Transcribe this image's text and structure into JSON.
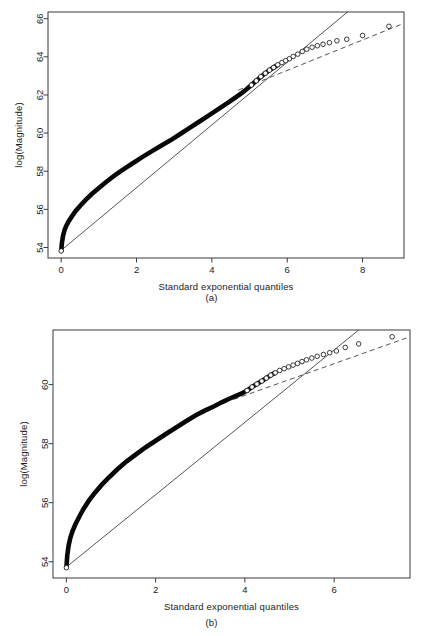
{
  "figure": {
    "panels": [
      {
        "id": "a",
        "caption": "(a)",
        "xlabel": "Standard exponential quantiles",
        "ylabel": "log(Magnitude)"
      },
      {
        "id": "b",
        "caption": "(b)",
        "xlabel": "Standard exponential quantiles",
        "ylabel": "log(Magnitude)"
      }
    ]
  },
  "chart_data": [
    {
      "type": "scatter",
      "panel": "(a)",
      "title": "",
      "xlabel": "Standard exponential quantiles",
      "ylabel": "log(Magnitude)",
      "xlim": [
        -0.35,
        9.1
      ],
      "ylim": [
        53.45,
        66.35
      ],
      "xticks": [
        0,
        2,
        4,
        6,
        8
      ],
      "yticks": [
        54,
        56,
        58,
        60,
        62,
        64,
        66
      ],
      "grid": false,
      "legend": "none",
      "marker": "open-circle",
      "series": [
        {
          "name": "sample quantiles",
          "note": "dense overlapping points form a continuous band at low quantiles, discrete circles in the upper tail",
          "x": [
            0.0,
            0.02,
            0.05,
            0.09,
            0.14,
            0.2,
            0.28,
            0.38,
            0.5,
            0.65,
            0.82,
            1.0,
            1.2,
            1.42,
            1.65,
            1.9,
            2.15,
            2.4,
            2.65,
            2.9,
            3.15,
            3.4,
            3.62,
            3.85,
            4.05,
            4.25,
            4.45,
            4.62,
            4.78,
            4.92,
            5.05,
            5.18,
            5.3,
            5.42,
            5.53,
            5.64,
            5.75,
            5.86,
            5.96,
            6.06,
            6.16,
            6.28,
            6.4,
            6.52,
            6.66,
            6.8,
            6.95,
            7.12,
            7.32,
            7.58,
            8.0,
            8.7
          ],
          "y": [
            53.82,
            54.25,
            54.62,
            54.92,
            55.16,
            55.38,
            55.62,
            55.9,
            56.18,
            56.5,
            56.82,
            57.12,
            57.45,
            57.78,
            58.1,
            58.42,
            58.74,
            59.04,
            59.34,
            59.62,
            59.94,
            60.26,
            60.54,
            60.84,
            61.1,
            61.36,
            61.62,
            61.86,
            62.08,
            62.3,
            62.52,
            62.74,
            62.96,
            63.14,
            63.3,
            63.44,
            63.58,
            63.7,
            63.8,
            63.9,
            64.02,
            64.14,
            64.28,
            64.4,
            64.5,
            64.58,
            64.66,
            64.74,
            64.84,
            64.92,
            65.12,
            65.6
          ]
        }
      ],
      "reference_lines": [
        {
          "name": "solid-fit-line",
          "style": "solid",
          "x": [
            0.0,
            7.6
          ],
          "y": [
            53.85,
            66.35
          ]
        },
        {
          "name": "dashed-tail-line",
          "style": "dashed",
          "x": [
            4.7,
            9.05
          ],
          "y": [
            62.25,
            65.72
          ]
        }
      ]
    },
    {
      "type": "scatter",
      "panel": "(b)",
      "title": "",
      "xlabel": "Standard exponential quantiles",
      "ylabel": "log(Magnitude)",
      "xlim": [
        -0.3,
        7.7
      ],
      "ylim": [
        53.45,
        61.85
      ],
      "xticks": [
        0,
        2,
        4,
        6
      ],
      "yticks": [
        54,
        56,
        58,
        60
      ],
      "grid": false,
      "legend": "none",
      "marker": "open-circle",
      "series": [
        {
          "name": "sample quantiles",
          "note": "dense overlapping points form a continuous band at low quantiles, discrete circles in the upper tail",
          "x": [
            0.0,
            0.02,
            0.05,
            0.09,
            0.14,
            0.2,
            0.28,
            0.38,
            0.5,
            0.64,
            0.8,
            0.97,
            1.15,
            1.35,
            1.56,
            1.78,
            2.0,
            2.22,
            2.45,
            2.68,
            2.9,
            3.1,
            3.3,
            3.48,
            3.65,
            3.8,
            3.93,
            4.05,
            4.16,
            4.27,
            4.38,
            4.48,
            4.58,
            4.68,
            4.78,
            4.88,
            4.98,
            5.08,
            5.18,
            5.28,
            5.38,
            5.5,
            5.62,
            5.76,
            5.9,
            6.05,
            6.25,
            6.55,
            7.3
          ],
          "y": [
            53.8,
            54.22,
            54.55,
            54.82,
            55.05,
            55.26,
            55.5,
            55.78,
            56.06,
            56.34,
            56.62,
            56.88,
            57.14,
            57.4,
            57.64,
            57.88,
            58.1,
            58.32,
            58.54,
            58.76,
            58.96,
            59.12,
            59.26,
            59.4,
            59.52,
            59.62,
            59.7,
            59.8,
            59.92,
            60.02,
            60.12,
            60.22,
            60.32,
            60.4,
            60.48,
            60.54,
            60.6,
            60.66,
            60.72,
            60.78,
            60.84,
            60.9,
            60.96,
            61.02,
            61.08,
            61.14,
            61.26,
            61.38,
            61.62
          ]
        }
      ],
      "reference_lines": [
        {
          "name": "solid-fit-line",
          "style": "solid",
          "x": [
            0.0,
            6.55
          ],
          "y": [
            53.82,
            61.85
          ]
        },
        {
          "name": "dashed-tail-line",
          "style": "dashed",
          "x": [
            3.75,
            7.62
          ],
          "y": [
            59.5,
            61.58
          ]
        }
      ]
    }
  ]
}
